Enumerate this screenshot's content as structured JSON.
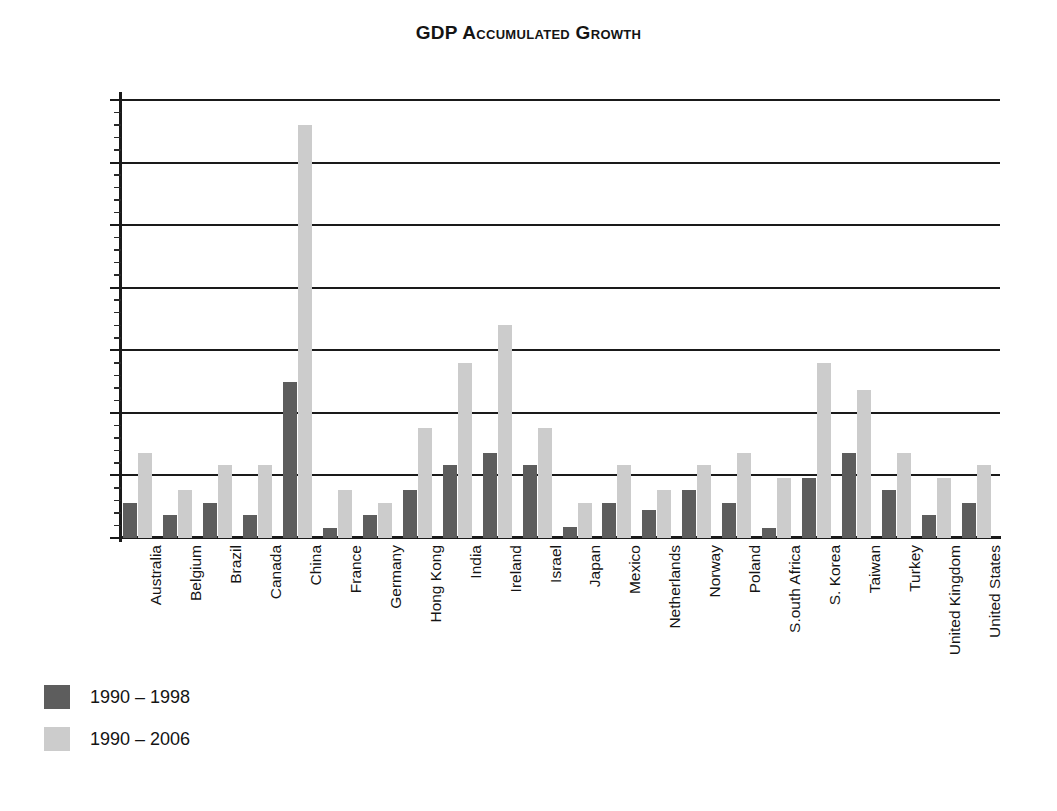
{
  "chart_data": {
    "type": "bar",
    "title": "GDP Accumulated Growth",
    "xlabel": "",
    "ylabel": "",
    "ylim": [
      0,
      350
    ],
    "ytick_step": 50,
    "yminor_step": 10,
    "ytick_labels": [
      "0%",
      "50%",
      "100%",
      "150%",
      "200%",
      "250%",
      "300%",
      "350%"
    ],
    "ytick_values": [
      0,
      50,
      100,
      150,
      200,
      250,
      300,
      350
    ],
    "grid": true,
    "legend_position": "bottom-left",
    "categories": [
      "Australia",
      "Belgium",
      "Brazil",
      "Canada",
      "China",
      "France",
      "Germany",
      "Hong Kong",
      "India",
      "Ireland",
      "Israel",
      "Japan",
      "Mexico",
      "Netherlands",
      "Norway",
      "Poland",
      "S.outh Africa",
      "S. Korea",
      "Taiwan",
      "Turkey",
      "United Kingdom",
      "United States"
    ],
    "series": [
      {
        "name": "1990 – 1998",
        "color": "#5d5d5d",
        "values": [
          28,
          18,
          28,
          18,
          125,
          8,
          18,
          38,
          58,
          68,
          58,
          9,
          28,
          22,
          38,
          28,
          8,
          48,
          68,
          38,
          18,
          28
        ]
      },
      {
        "name": "1990 – 2006",
        "color": "#cccccc",
        "values": [
          68,
          38,
          58,
          58,
          330,
          38,
          28,
          88,
          140,
          170,
          88,
          28,
          58,
          38,
          58,
          68,
          48,
          140,
          118,
          68,
          48,
          58
        ]
      }
    ]
  },
  "legend": {
    "items": [
      {
        "label": "1990 – 1998",
        "color": "#5d5d5d"
      },
      {
        "label": "1990 – 2006",
        "color": "#cccccc"
      }
    ]
  },
  "colors": {
    "series_1990_1998": "#5d5d5d",
    "series_1990_2006": "#cccccc",
    "axis": "#1a1a1a",
    "background": "#ffffff"
  }
}
